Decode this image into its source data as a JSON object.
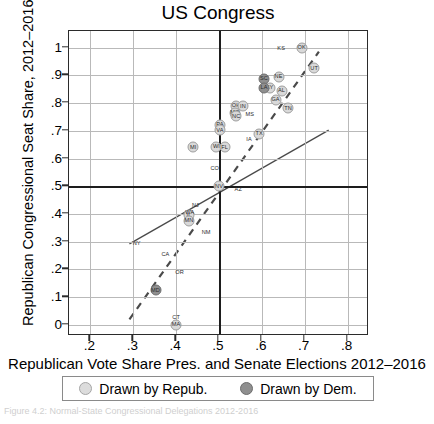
{
  "chart_data": {
    "type": "scatter",
    "title": "US Congress",
    "xlabel": "Republican Vote Share Pres. and Senate Elections 2012–2016",
    "ylabel": "Republican Congressional Seat Share, 2012–2016",
    "xlim": [
      0.15,
      0.85
    ],
    "ylim": [
      -0.04,
      1.06
    ],
    "xticks": [
      ".2",
      ".3",
      ".4",
      ".5",
      ".6",
      ".7",
      ".8"
    ],
    "xtick_values": [
      0.2,
      0.3,
      0.4,
      0.5,
      0.6,
      0.7,
      0.8
    ],
    "yticks": [
      "0",
      ".1",
      ".2",
      ".3",
      ".4",
      ".5",
      ".6",
      ".7",
      ".8",
      ".9",
      "1"
    ],
    "ytick_values": [
      0,
      0.1,
      0.2,
      0.3,
      0.4,
      0.5,
      0.6,
      0.7,
      0.8,
      0.9,
      1.0
    ],
    "grid": true,
    "reference_lines": {
      "x": 0.5,
      "y": 0.5
    },
    "legend_position": "below",
    "series": [
      {
        "name": "Drawn by Repub.",
        "color": "#d9d9d9",
        "points": [
          {
            "label": "OK",
            "x": 0.693,
            "y": 1.0
          },
          {
            "label": "UT",
            "x": 0.722,
            "y": 0.925
          },
          {
            "label": "NE",
            "x": 0.639,
            "y": 0.895
          },
          {
            "label": "KY",
            "x": 0.618,
            "y": 0.855
          },
          {
            "label": "AL",
            "x": 0.646,
            "y": 0.845
          },
          {
            "label": "GA",
            "x": 0.632,
            "y": 0.812
          },
          {
            "label": "TN",
            "x": 0.661,
            "y": 0.782
          },
          {
            "label": "OH",
            "x": 0.54,
            "y": 0.79
          },
          {
            "label": "IN",
            "x": 0.556,
            "y": 0.788
          },
          {
            "label": "MO",
            "x": 0.537,
            "y": 0.766
          },
          {
            "label": "NC",
            "x": 0.54,
            "y": 0.752
          },
          {
            "label": "PA",
            "x": 0.502,
            "y": 0.722
          },
          {
            "label": "VA",
            "x": 0.502,
            "y": 0.702
          },
          {
            "label": "TX",
            "x": 0.594,
            "y": 0.69
          },
          {
            "label": "WI",
            "x": 0.494,
            "y": 0.642
          },
          {
            "label": "FL",
            "x": 0.513,
            "y": 0.64
          },
          {
            "label": "MI",
            "x": 0.44,
            "y": 0.64
          },
          {
            "label": "NV",
            "x": 0.5,
            "y": 0.5
          },
          {
            "label": "IL",
            "x": 0.43,
            "y": 0.395
          },
          {
            "label": "MN",
            "x": 0.43,
            "y": 0.375
          },
          {
            "label": "MA",
            "x": 0.4,
            "y": 0.0
          }
        ]
      },
      {
        "name": "Drawn by Dem.",
        "color": "#8f8f8f",
        "points": [
          {
            "label": "SC",
            "x": 0.605,
            "y": 0.888
          },
          {
            "label": "LA",
            "x": 0.605,
            "y": 0.855
          },
          {
            "label": "MD",
            "x": 0.352,
            "y": 0.125
          }
        ]
      }
    ],
    "unmarked_labels": [
      {
        "label": "KS",
        "x": 0.645,
        "y": 1.0
      },
      {
        "label": "MS",
        "x": 0.572,
        "y": 0.762
      },
      {
        "label": "IA",
        "x": 0.57,
        "y": 0.672
      },
      {
        "label": "AZ",
        "x": 0.545,
        "y": 0.49
      },
      {
        "label": "CO",
        "x": 0.49,
        "y": 0.565
      },
      {
        "label": "NJ",
        "x": 0.445,
        "y": 0.432
      },
      {
        "label": "WA",
        "x": 0.432,
        "y": 0.408
      },
      {
        "label": "NM",
        "x": 0.47,
        "y": 0.335
      },
      {
        "label": "NY",
        "x": 0.308,
        "y": 0.295
      },
      {
        "label": "CA",
        "x": 0.375,
        "y": 0.255
      },
      {
        "label": "OR",
        "x": 0.408,
        "y": 0.19
      },
      {
        "label": "CT",
        "x": 0.4,
        "y": 0.028
      }
    ],
    "trend_lines": [
      {
        "name": "dashed-fit",
        "style": "dashed",
        "x1": 0.292,
        "y1": 0.013,
        "x2": 0.737,
        "y2": 0.985
      },
      {
        "name": "solid-fit",
        "style": "solid",
        "x1": 0.292,
        "y1": 0.287,
        "x2": 0.76,
        "y2": 0.7
      }
    ]
  },
  "legend": {
    "items": [
      {
        "label": "Drawn by Repub.",
        "marker": "light-circle"
      },
      {
        "label": "Drawn by Dem.",
        "marker": "dark-circle"
      }
    ]
  },
  "caption": "Figure 4.2: Normal-State Congressional Delegations 2012-2016"
}
